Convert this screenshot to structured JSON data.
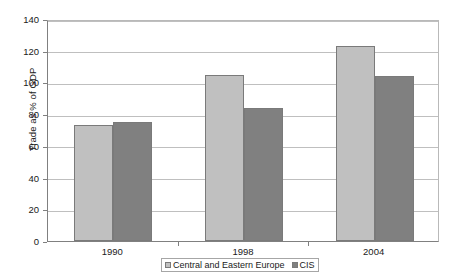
{
  "chart_data": {
    "type": "bar",
    "title": "",
    "xlabel": "",
    "ylabel": "Trade as % of GDP",
    "categories": [
      "1990",
      "1998",
      "2004"
    ],
    "series": [
      {
        "name": "Central and Eastern Europe",
        "color": "#c0c0c0",
        "values": [
          73,
          105,
          123
        ]
      },
      {
        "name": "CIS",
        "color": "#808080",
        "values": [
          75,
          84,
          104
        ]
      }
    ],
    "ylim": [
      0,
      140
    ],
    "ytick_step": 20,
    "yticks": [
      "0",
      "20",
      "40",
      "60",
      "80",
      "100",
      "120",
      "140"
    ],
    "grid": true,
    "legend_position": "bottom"
  },
  "legend": {
    "items": [
      {
        "label": "Central and Eastern Europe"
      },
      {
        "label": "CIS"
      }
    ]
  }
}
